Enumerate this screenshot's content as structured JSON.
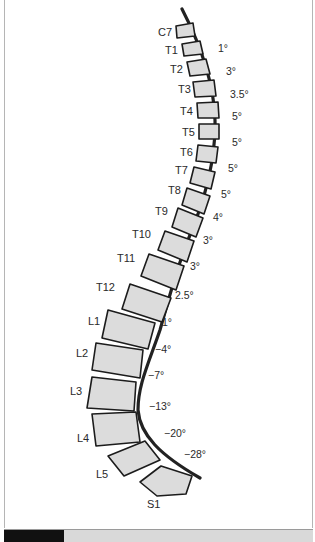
{
  "figure": {
    "type": "sagittal spine diagram",
    "colors": {
      "vertebra_fill": "#dcdcdc",
      "outline": "#1c1c1c",
      "curve": "#222222",
      "caption_tag": "#111111",
      "caption_bar": "#d9d9d9"
    },
    "vertebrae": [
      {
        "label": "C7"
      },
      {
        "label": "T1"
      },
      {
        "label": "T2"
      },
      {
        "label": "T3"
      },
      {
        "label": "T4"
      },
      {
        "label": "T5"
      },
      {
        "label": "T6"
      },
      {
        "label": "T7"
      },
      {
        "label": "T8"
      },
      {
        "label": "T9"
      },
      {
        "label": "T10"
      },
      {
        "label": "T11"
      },
      {
        "label": "T12"
      },
      {
        "label": "L1"
      },
      {
        "label": "L2"
      },
      {
        "label": "L3"
      },
      {
        "label": "L4"
      },
      {
        "label": "L5"
      },
      {
        "label": "S1"
      }
    ],
    "angles": [
      "1°",
      "3°",
      "3.5°",
      "5°",
      "5°",
      "5°",
      "5°",
      "4°",
      "3°",
      "3°",
      "2.5°",
      "1°",
      "−4°",
      "−7°",
      "−13°",
      "−20°",
      "−28°"
    ]
  },
  "caption": {
    "text": ""
  }
}
